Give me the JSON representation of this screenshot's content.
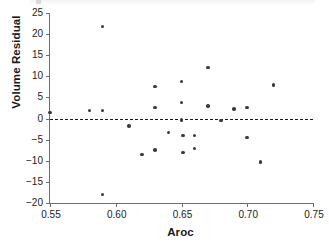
{
  "figure": {
    "background_color": "#ffffff",
    "point_color": "#3a3a3a",
    "axis_color": "#6e6e6e",
    "reference_line_color": "#1a1a1a"
  },
  "chart_data": {
    "type": "scatter",
    "title": "",
    "xlabel": "Aroc",
    "ylabel": "Volume Residual",
    "xlim": [
      0.55,
      0.75
    ],
    "ylim": [
      -20,
      25
    ],
    "xticks": [
      0.55,
      0.6,
      0.65,
      0.7,
      0.75
    ],
    "xtick_labels": [
      "0.55",
      "0.60",
      "0.65",
      "0.70",
      "0.75"
    ],
    "yticks": [
      -20,
      -15,
      -10,
      -5,
      0,
      5,
      10,
      15,
      20,
      25
    ],
    "ytick_labels": [
      "−20",
      "−15",
      "−10",
      "−5",
      "0",
      "5",
      "10",
      "15",
      "20",
      "25"
    ],
    "grid": false,
    "legend": null,
    "reference_lines": [
      {
        "orientation": "horizontal",
        "y": 0,
        "style": "dashed",
        "label": ""
      }
    ],
    "points": [
      {
        "x": 0.55,
        "y": 1.4
      },
      {
        "x": 0.58,
        "y": 1.9
      },
      {
        "x": 0.59,
        "y": 21.8
      },
      {
        "x": 0.59,
        "y": 1.9
      },
      {
        "x": 0.59,
        "y": -18.0
      },
      {
        "x": 0.61,
        "y": -1.8
      },
      {
        "x": 0.62,
        "y": -8.5
      },
      {
        "x": 0.63,
        "y": 7.6
      },
      {
        "x": 0.63,
        "y": 2.6
      },
      {
        "x": 0.63,
        "y": -7.4
      },
      {
        "x": 0.64,
        "y": -3.3
      },
      {
        "x": 0.65,
        "y": 8.8
      },
      {
        "x": 0.65,
        "y": 3.8
      },
      {
        "x": 0.65,
        "y": -0.4
      },
      {
        "x": 0.651,
        "y": -4.0
      },
      {
        "x": 0.651,
        "y": -8.0
      },
      {
        "x": 0.66,
        "y": -4.0
      },
      {
        "x": 0.66,
        "y": -7.1
      },
      {
        "x": 0.67,
        "y": 12.1
      },
      {
        "x": 0.67,
        "y": 3.0
      },
      {
        "x": 0.68,
        "y": -0.5
      },
      {
        "x": 0.69,
        "y": 2.3
      },
      {
        "x": 0.7,
        "y": 2.6
      },
      {
        "x": 0.7,
        "y": -4.5
      },
      {
        "x": 0.71,
        "y": -10.3
      },
      {
        "x": 0.72,
        "y": 7.9
      }
    ]
  }
}
